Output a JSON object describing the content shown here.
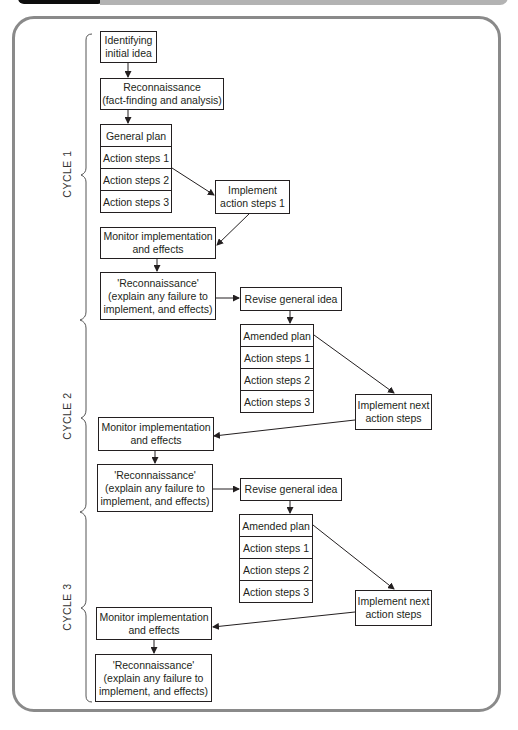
{
  "diagram": {
    "cycles": [
      {
        "label": "CYCLE 1"
      },
      {
        "label": "CYCLE 2"
      },
      {
        "label": "CYCLE 3"
      }
    ],
    "cycle1": {
      "identify": [
        "Identifying",
        "initial idea"
      ],
      "recon": [
        "Reconnaissance",
        "(fact-finding and analysis)"
      ],
      "plan": [
        "General plan",
        "Action steps 1",
        "Action steps 2",
        "Action steps 3"
      ],
      "implement": [
        "Implement",
        "action steps 1"
      ],
      "monitor": [
        "Monitor implementation",
        "and effects"
      ],
      "recon2": [
        "'Reconnaissance'",
        "(explain any failure to",
        "implement, and effects)"
      ],
      "revise": "Revise general idea"
    },
    "cycle2": {
      "plan": [
        "Amended plan",
        "Action steps 1",
        "Action steps 2",
        "Action steps 3"
      ],
      "implement": [
        "Implement next",
        "action steps"
      ],
      "monitor": [
        "Monitor implementation",
        "and effects"
      ],
      "recon": [
        "'Reconnaissance'",
        "(explain any failure to",
        "implement, and effects)"
      ],
      "revise": "Revise general idea"
    },
    "cycle3": {
      "plan": [
        "Amended plan",
        "Action steps 1",
        "Action steps 2",
        "Action steps 3"
      ],
      "implement": [
        "Implement next",
        "action steps"
      ],
      "monitor": [
        "Monitor implementation",
        "and effects"
      ],
      "recon": [
        "'Reconnaissance'",
        "(explain any failure to",
        "implement, and effects)"
      ]
    },
    "colors": {
      "line": "#231f20",
      "frame": "#8a8a8a",
      "header_dark": "#0d0d0d",
      "header_grey": "#b3b3b3"
    }
  }
}
